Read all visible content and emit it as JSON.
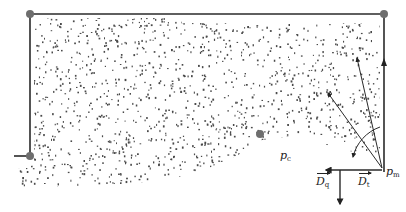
{
  "diagram": {
    "labels": {
      "pm_base": "p",
      "pm_sub": "m",
      "pc_base": "p",
      "pc_sub": "c",
      "dt_base": "D",
      "dt_sub": "t",
      "dq_base": "D",
      "dq_sub": "q"
    },
    "colors": {
      "line": "#2a2a2a",
      "node": "#6e6e6e",
      "dots": "#4a4a4a",
      "background": "#ffffff"
    },
    "frame": {
      "top_y": 14,
      "left_x": 30,
      "right_x": 384,
      "left_bottom_y": 156,
      "right_bottom_y": 172
    },
    "nodes": [
      {
        "name": "top-left-node",
        "x": 30,
        "y": 14
      },
      {
        "name": "top-right-node",
        "x": 384,
        "y": 14
      },
      {
        "name": "bottom-left-node",
        "x": 30,
        "y": 156
      },
      {
        "name": "front-node",
        "x": 260,
        "y": 134
      }
    ],
    "origin_point": {
      "name": "p_m",
      "x": 382,
      "y": 170
    }
  }
}
